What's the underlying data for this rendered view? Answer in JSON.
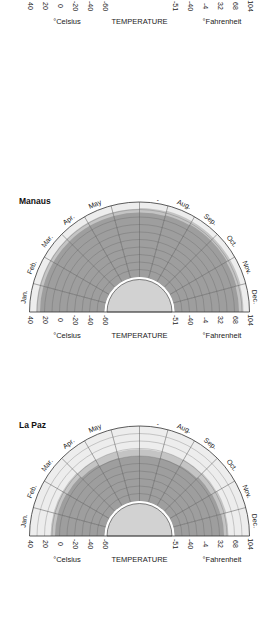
{
  "chart_data": [
    {
      "type": "radial-area",
      "title": "",
      "xlabel": "TEMPERATURE",
      "left_unit": "°Celsius",
      "right_unit": "°Fahrenheit",
      "categories": [
        "Jan.",
        "Feb.",
        "Mar.",
        "Apr.",
        "May",
        "June",
        "July",
        "Aug.",
        "Sep.",
        "Oct.",
        "Nov.",
        "Dec."
      ],
      "celsius_ticks": [
        "40",
        "20",
        "0",
        "-20",
        "-40",
        "-60"
      ],
      "fahrenheit_ticks": [
        "-51",
        "-40",
        "-4",
        "32",
        "68",
        "104"
      ],
      "range_c": [
        -60,
        40
      ],
      "series": [
        {
          "name": "max",
          "values": [
            23,
            22,
            20,
            18,
            16,
            15,
            15,
            16,
            18,
            20,
            22,
            23
          ]
        },
        {
          "name": "min",
          "values": [
            20,
            19,
            17,
            15,
            13,
            12,
            12,
            13,
            15,
            17,
            19,
            20
          ]
        }
      ]
    },
    {
      "type": "radial-area",
      "title": "Manaus",
      "xlabel": "TEMPERATURE",
      "left_unit": "°Celsius",
      "right_unit": "°Fahrenheit",
      "categories": [
        "Jan.",
        "Feb.",
        "Mar.",
        "Apr.",
        "May",
        "June",
        "July",
        "Aug.",
        "Sep.",
        "Oct.",
        "Nov.",
        "Dec."
      ],
      "celsius_ticks": [
        "40",
        "20",
        "0",
        "-20",
        "-40",
        "-60"
      ],
      "fahrenheit_ticks": [
        "-51",
        "-40",
        "-4",
        "32",
        "68",
        "104"
      ],
      "range_c": [
        -60,
        40
      ],
      "series": [
        {
          "name": "max",
          "values": [
            31,
            31,
            31,
            31,
            31,
            31,
            32,
            33,
            33,
            33,
            33,
            32
          ]
        },
        {
          "name": "min",
          "values": [
            26,
            26,
            26,
            26,
            26,
            26,
            26,
            27,
            28,
            28,
            27,
            26
          ]
        }
      ]
    },
    {
      "type": "radial-area",
      "title": "La Paz",
      "xlabel": "TEMPERATURE",
      "left_unit": "°Celsius",
      "right_unit": "°Fahrenheit",
      "categories": [
        "Jan.",
        "Feb.",
        "Mar.",
        "Apr.",
        "May",
        "June",
        "July",
        "Aug.",
        "Sep.",
        "Oct.",
        "Nov.",
        "Dec."
      ],
      "celsius_ticks": [
        "40",
        "20",
        "0",
        "-20",
        "-40",
        "-60"
      ],
      "fahrenheit_ticks": [
        "-51",
        "-40",
        "-4",
        "32",
        "68",
        "104"
      ],
      "range_c": [
        -60,
        40
      ],
      "series": [
        {
          "name": "max",
          "values": [
            12,
            12,
            12,
            11,
            10,
            9,
            9,
            10,
            11,
            12,
            13,
            12
          ]
        },
        {
          "name": "min",
          "values": [
            6,
            6,
            5,
            3,
            1,
            0,
            0,
            1,
            2,
            4,
            5,
            6
          ]
        }
      ]
    }
  ],
  "charts": [
    {
      "title": "",
      "top": -114
    },
    {
      "title": "Manaus",
      "top": 200
    },
    {
      "title": "La Paz",
      "top": 424
    }
  ],
  "colors": {
    "dark_band": "#9e9e9e",
    "light_band": "#c4c4c4",
    "outer_fill": "#ededed",
    "inner_fill": "#d2d2d2",
    "grid": "#555555",
    "axis": "#333333"
  }
}
